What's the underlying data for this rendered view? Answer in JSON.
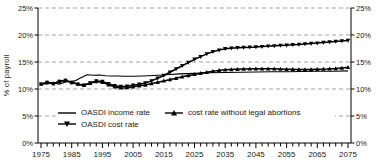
{
  "colors": {
    "line": "#000000",
    "grid": "#a3a3a3",
    "text": "#1a1a1a",
    "background": "#ffffff"
  },
  "chart_data": {
    "type": "line",
    "title": "",
    "xlabel": "",
    "ylabel": "% of payroll",
    "ylim": [
      0,
      25
    ],
    "xlim": [
      1975,
      2075
    ],
    "grid": "horizontal-dashed",
    "legend_position": "inside-bottom",
    "y_ticks": [
      0,
      5,
      10,
      15,
      20,
      25
    ],
    "y_tick_labels": [
      "0%",
      "5%",
      "10%",
      "15%",
      "20%",
      "25%"
    ],
    "x_ticks": [
      1975,
      1985,
      1995,
      2005,
      2015,
      2025,
      2035,
      2045,
      2055,
      2065,
      2075
    ],
    "minor_x_tick_step_years": 2,
    "series": [
      {
        "name": "OASDI income rate",
        "marker": "none",
        "points": [
          [
            1975,
            10.9
          ],
          [
            1977,
            11.0
          ],
          [
            1979,
            11.1
          ],
          [
            1981,
            10.9
          ],
          [
            1983,
            11.3
          ],
          [
            1985,
            11.4
          ],
          [
            1986,
            11.5
          ],
          [
            1988,
            12.1
          ],
          [
            1990,
            12.65
          ],
          [
            1992,
            12.55
          ],
          [
            1994,
            12.6
          ],
          [
            1996,
            12.45
          ],
          [
            1998,
            12.4
          ],
          [
            2000,
            12.4
          ],
          [
            2002,
            12.35
          ],
          [
            2005,
            12.35
          ],
          [
            2008,
            12.4
          ],
          [
            2010,
            12.45
          ],
          [
            2013,
            12.55
          ],
          [
            2016,
            12.65
          ],
          [
            2020,
            12.8
          ],
          [
            2025,
            12.9
          ],
          [
            2030,
            13.0
          ],
          [
            2035,
            13.05
          ],
          [
            2040,
            13.1
          ],
          [
            2045,
            13.15
          ],
          [
            2050,
            13.2
          ],
          [
            2055,
            13.2
          ],
          [
            2060,
            13.25
          ],
          [
            2065,
            13.3
          ],
          [
            2070,
            13.3
          ],
          [
            2075,
            13.35
          ]
        ]
      },
      {
        "name": "OASDI cost rate",
        "marker": "triangle-down",
        "points": [
          [
            1975,
            10.9
          ],
          [
            1977,
            11.2
          ],
          [
            1979,
            11.0
          ],
          [
            1981,
            11.4
          ],
          [
            1983,
            11.6
          ],
          [
            1985,
            11.2
          ],
          [
            1987,
            10.9
          ],
          [
            1989,
            10.7
          ],
          [
            1991,
            11.1
          ],
          [
            1993,
            11.5
          ],
          [
            1995,
            11.4
          ],
          [
            1997,
            11.0
          ],
          [
            1999,
            10.6
          ],
          [
            2001,
            10.45
          ],
          [
            2003,
            10.5
          ],
          [
            2005,
            10.7
          ],
          [
            2007,
            10.9
          ],
          [
            2009,
            11.1
          ],
          [
            2011,
            11.5
          ],
          [
            2013,
            12.0
          ],
          [
            2015,
            12.5
          ],
          [
            2017,
            13.1
          ],
          [
            2019,
            13.7
          ],
          [
            2021,
            14.3
          ],
          [
            2023,
            14.9
          ],
          [
            2025,
            15.5
          ],
          [
            2027,
            16.0
          ],
          [
            2029,
            16.5
          ],
          [
            2031,
            16.9
          ],
          [
            2033,
            17.2
          ],
          [
            2035,
            17.45
          ],
          [
            2038,
            17.6
          ],
          [
            2041,
            17.7
          ],
          [
            2044,
            17.75
          ],
          [
            2047,
            17.85
          ],
          [
            2050,
            17.95
          ],
          [
            2053,
            18.05
          ],
          [
            2056,
            18.15
          ],
          [
            2059,
            18.25
          ],
          [
            2062,
            18.4
          ],
          [
            2065,
            18.5
          ],
          [
            2068,
            18.65
          ],
          [
            2071,
            18.8
          ],
          [
            2075,
            19.0
          ]
        ]
      },
      {
        "name": "cost rate without legal abortions",
        "marker": "triangle-up",
        "points": [
          [
            1975,
            10.9
          ],
          [
            1977,
            11.2
          ],
          [
            1979,
            11.0
          ],
          [
            1981,
            11.4
          ],
          [
            1983,
            11.6
          ],
          [
            1985,
            11.2
          ],
          [
            1987,
            10.9
          ],
          [
            1989,
            10.7
          ],
          [
            1991,
            11.05
          ],
          [
            1993,
            11.4
          ],
          [
            1995,
            11.25
          ],
          [
            1997,
            10.8
          ],
          [
            1999,
            10.4
          ],
          [
            2001,
            10.2
          ],
          [
            2003,
            10.25
          ],
          [
            2005,
            10.4
          ],
          [
            2007,
            10.6
          ],
          [
            2009,
            10.75
          ],
          [
            2011,
            11.0
          ],
          [
            2013,
            11.25
          ],
          [
            2015,
            11.5
          ],
          [
            2017,
            11.75
          ],
          [
            2019,
            12.0
          ],
          [
            2021,
            12.25
          ],
          [
            2023,
            12.5
          ],
          [
            2025,
            12.7
          ],
          [
            2027,
            12.9
          ],
          [
            2029,
            13.1
          ],
          [
            2031,
            13.3
          ],
          [
            2033,
            13.45
          ],
          [
            2035,
            13.55
          ],
          [
            2038,
            13.65
          ],
          [
            2041,
            13.7
          ],
          [
            2044,
            13.75
          ],
          [
            2047,
            13.75
          ],
          [
            2050,
            13.75
          ],
          [
            2053,
            13.7
          ],
          [
            2056,
            13.65
          ],
          [
            2059,
            13.6
          ],
          [
            2062,
            13.6
          ],
          [
            2065,
            13.65
          ],
          [
            2068,
            13.7
          ],
          [
            2071,
            13.8
          ],
          [
            2075,
            14.0
          ]
        ]
      }
    ]
  }
}
